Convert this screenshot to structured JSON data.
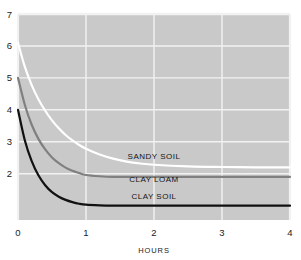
{
  "chart_data": {
    "type": "line",
    "title": "",
    "subtitle": "",
    "xlabel": "HOURS",
    "ylabel": "",
    "xlim": [
      0,
      4
    ],
    "ylim": [
      0.55,
      7
    ],
    "grid": true,
    "legend_position": "inline-right",
    "plot_background": "#c9c9c9",
    "gridline_color": "#f2f2f2",
    "x_ticks": [
      "0",
      "1",
      "2",
      "3",
      "4"
    ],
    "x_tick_values": [
      0,
      1,
      2,
      3,
      4
    ],
    "y_ticks": [
      "2",
      "3",
      "4",
      "5",
      "6",
      "7"
    ],
    "y_tick_values": [
      2,
      3,
      4,
      5,
      6,
      7
    ],
    "x": [
      0,
      0.1,
      0.2,
      0.3,
      0.4,
      0.5,
      0.6,
      0.7,
      0.8,
      0.9,
      1.0,
      1.2,
      1.4,
      1.6,
      1.8,
      2.0,
      2.5,
      3.0,
      3.5,
      4.0
    ],
    "series": [
      {
        "name": "SANDY SOIL",
        "color": "#ffffff",
        "label_x": 2.0,
        "label_y": 2.45,
        "start_value": 6.1,
        "plateau_value": 2.2,
        "values": [
          6.1,
          5.35,
          4.78,
          4.33,
          3.97,
          3.67,
          3.42,
          3.21,
          3.04,
          2.9,
          2.78,
          2.6,
          2.47,
          2.38,
          2.32,
          2.28,
          2.23,
          2.21,
          2.2,
          2.2
        ]
      },
      {
        "name": "CLAY LOAM",
        "color": "#808080",
        "label_x": 2.0,
        "label_y": 1.75,
        "start_value": 5.0,
        "plateau_value": 1.9,
        "values": [
          5.0,
          4.16,
          3.54,
          3.09,
          2.76,
          2.51,
          2.33,
          2.19,
          2.09,
          2.02,
          1.96,
          1.92,
          1.9,
          1.9,
          1.9,
          1.9,
          1.9,
          1.9,
          1.9,
          1.9
        ]
      },
      {
        "name": "CLAY SOIL",
        "color": "#111111",
        "label_x": 2.0,
        "label_y": 1.22,
        "start_value": 4.0,
        "plateau_value": 1.0,
        "values": [
          4.0,
          3.05,
          2.4,
          1.95,
          1.64,
          1.42,
          1.28,
          1.18,
          1.11,
          1.06,
          1.03,
          1.01,
          1.0,
          1.0,
          1.0,
          1.0,
          1.0,
          1.0,
          1.0,
          1.0
        ]
      }
    ]
  }
}
